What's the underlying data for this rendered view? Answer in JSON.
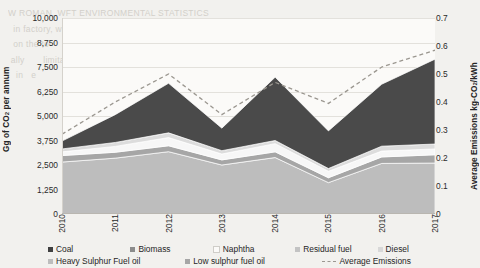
{
  "ghost_text": "W ROMAN, WFT ENVIRONMENTAL STATISTICS\n  in factory, while energy rating and or  a\n  on the to            consumption of\n ally       limitation       the  for\n   in   e                       s  mo\n\n\n\n\n\n\n\n\n\n\n\n\n\n  up t                     of  co\n  pm                                nuary\n  figure 5-19 with a   delegate number 1 to   lam (1) per category",
  "chart_data": {
    "type": "area",
    "stacked": true,
    "title": "",
    "xlabel": "",
    "ylabel": "Gg of CO2 per annum",
    "y2label": "Average Emissions kg-CO2/kWh",
    "grid": true,
    "legend_position": "bottom",
    "categories": [
      "2010",
      "2011",
      "2012",
      "2013",
      "2014",
      "2015",
      "2016",
      "2017"
    ],
    "ylim": [
      0,
      10000
    ],
    "yticks": [
      0,
      1250,
      2500,
      3750,
      5000,
      6250,
      7500,
      8750,
      10000
    ],
    "ytick_labels": [
      "0",
      "1,250",
      "2,500",
      "3,750",
      "5,000",
      "6,250",
      "7,500",
      "8,750",
      "10,000"
    ],
    "y2lim": [
      0,
      0.7
    ],
    "y2ticks": [
      0,
      0.1,
      0.2,
      0.3,
      0.4,
      0.5,
      0.6,
      0.7
    ],
    "y2tick_labels": [
      "0",
      "0.1",
      "0.2",
      "0.3",
      "0.4",
      "0.5",
      "0.6",
      "0.7"
    ],
    "series": [
      {
        "name": "Coal",
        "color": "#404040",
        "values": [
          0,
          0,
          0,
          0,
          0,
          0,
          0,
          0
        ]
      },
      {
        "name": "Biomass",
        "color": "#808080",
        "values": [
          0,
          0,
          0,
          0,
          0,
          0,
          0,
          0
        ]
      },
      {
        "name": "Naphtha",
        "color": "#ffffff",
        "values": [
          0,
          0,
          0,
          0,
          0,
          0,
          0,
          0
        ]
      },
      {
        "name": "Residual fuel",
        "color": "#c8c8c8",
        "values": [
          0,
          0,
          0,
          0,
          0,
          0,
          0,
          0
        ]
      },
      {
        "name": "Diesel",
        "color": "#d9d9d9",
        "values": [
          0,
          0,
          0,
          0,
          0,
          0,
          0,
          0
        ]
      },
      {
        "name": "Heavy Sulphur Fuel oil",
        "color": "#bdbdbd",
        "values": [
          2650,
          2850,
          3180,
          2500,
          2880,
          1600,
          2580,
          2600
        ]
      },
      {
        "name": "Low sulphur fuel oil",
        "color": "#a6a6a6",
        "values": [
          330,
          300,
          300,
          260,
          290,
          250,
          330,
          420
        ]
      },
      {
        "name": "Naphtha band",
        "color": "#f7f7f7",
        "values": [
          190,
          300,
          420,
          300,
          420,
          330,
          300,
          300
        ]
      },
      {
        "name": "Residual band",
        "color": "#dcdcdc",
        "values": [
          150,
          200,
          240,
          170,
          160,
          140,
          250,
          250
        ]
      },
      {
        "name": "Coal band",
        "color": "#4a4a4a",
        "values": [
          400,
          1420,
          2530,
          1150,
          3230,
          1920,
          3160,
          4330
        ]
      }
    ],
    "stack_totals": [
      3720,
      5070,
      6670,
      4380,
      6980,
      4240,
      6620,
      7900
    ],
    "average_emissions": {
      "name": "Average Emissions",
      "color": "#9b9790",
      "style": "dashed",
      "values": [
        0.285,
        0.4,
        0.5,
        0.355,
        0.47,
        0.395,
        0.525,
        0.585
      ]
    }
  },
  "legend": {
    "row1": [
      {
        "label": "Coal",
        "marker": "swatch",
        "color": "#404040"
      },
      {
        "label": "Biomass",
        "marker": "swatch",
        "color": "#8c8c8c"
      },
      {
        "label": "Naphtha",
        "marker": "swatch",
        "color": "#fbfaf8"
      },
      {
        "label": "Residual fuel",
        "marker": "swatch",
        "color": "#c3c3c3"
      },
      {
        "label": "Diesel",
        "marker": "swatch",
        "color": "#d8d8d8"
      }
    ],
    "row2": [
      {
        "label": "Heavy Sulphur Fuel oil",
        "marker": "swatch",
        "color": "#bdbdbd"
      },
      {
        "label": "Low sulphur fuel oil",
        "marker": "swatch",
        "color": "#a6a6a6"
      },
      {
        "label": "Average Emissions",
        "marker": "dash",
        "color": "#9b9790"
      }
    ]
  }
}
